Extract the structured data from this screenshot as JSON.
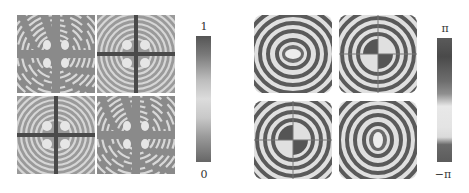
{
  "figure": {
    "left": {
      "description": "Intensity patterns, 2x2 grid",
      "colorbar": {
        "max_label": "1",
        "min_label": "0",
        "gradient": [
          "#555555",
          "#7a7a7a",
          "#bdbdbd",
          "#dcdcdc",
          "#c8c8c8",
          "#9a9a9a",
          "#666666"
        ]
      }
    },
    "right": {
      "description": "Phase patterns, 2x2 grid",
      "colorbar": {
        "max_label": "π",
        "min_label": "−π",
        "gradient": [
          "#5a5a5a",
          "#4a4a4a",
          "#6e6e6e",
          "#8f8f8f",
          "#e8e8e8",
          "#e4e4e4",
          "#dadada",
          "#6a6a6a",
          "#5c5c5c"
        ]
      }
    }
  }
}
